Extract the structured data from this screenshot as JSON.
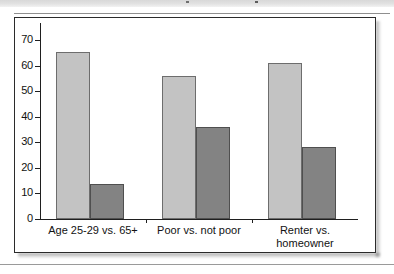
{
  "figure": {
    "frame_border_color": "#2b2b2b",
    "background_color": "#ffffff"
  },
  "chart_data": {
    "type": "bar",
    "title": "",
    "subtitle": "",
    "xlabel": "",
    "ylabel": "",
    "ylim": [
      0,
      70
    ],
    "ytick_step": 10,
    "grid": false,
    "legend": "none",
    "categories": [
      "Age 25-29 vs. 65+",
      "Poor vs. not poor",
      "Renter vs. homeowner"
    ],
    "category_lines": [
      [
        "Age 25-29 vs. 65+"
      ],
      [
        "Poor vs. not poor"
      ],
      [
        "Renter vs.",
        "homeowner"
      ]
    ],
    "ytick_labels": [
      "0",
      "10",
      "20",
      "30",
      "40",
      "50",
      "60",
      "70"
    ],
    "series": [
      {
        "name": "light-series",
        "color": "#c3c3c3",
        "values": [
          65.5,
          56,
          61
        ]
      },
      {
        "name": "dark-series",
        "color": "#838383",
        "values": [
          13.5,
          36,
          28
        ]
      }
    ]
  }
}
